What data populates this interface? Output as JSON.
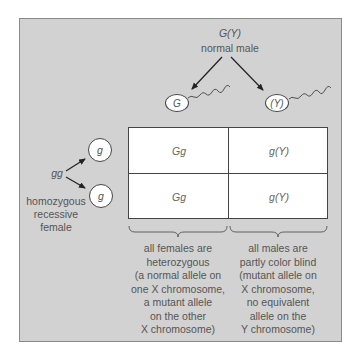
{
  "male": {
    "genotype": "G(Y)",
    "label": "normal male",
    "gametes": [
      {
        "allele": "G"
      },
      {
        "allele": "(Y)"
      }
    ]
  },
  "female": {
    "genotype": "gg",
    "label_lines": [
      "homozygous",
      "recessive",
      "female"
    ],
    "gametes": [
      {
        "allele": "g"
      },
      {
        "allele": "g"
      }
    ]
  },
  "punnett": {
    "rows": [
      [
        "Gg",
        "g(Y)"
      ],
      [
        "Gg",
        "g(Y)"
      ]
    ]
  },
  "notes": {
    "females": [
      "all females are",
      "heterozygous",
      "(a normal allele on",
      "one X chromosome,",
      "a mutant allele",
      "on the other",
      "X chromosome)"
    ],
    "males": [
      "all males are",
      "partly color blind",
      "(mutant allele on",
      "X chromosome,",
      "no equivalent",
      "allele on the",
      "Y chromosome)"
    ]
  },
  "colors": {
    "panel": "#d2d2d2",
    "line": "#444444",
    "text": "#555555"
  }
}
